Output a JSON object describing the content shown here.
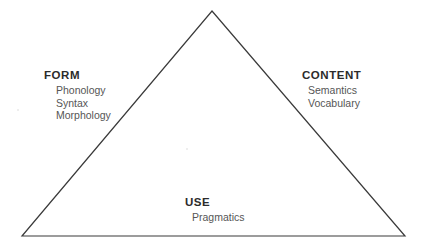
{
  "diagram": {
    "type": "triangle-model",
    "background_color": "#ffffff",
    "stroke_color": "#3a3a3a",
    "heading_color": "#2b2b2b",
    "subtext_color": "#565656",
    "geometry": {
      "apex": [
        212,
        11
      ],
      "bottom_left": [
        22,
        236
      ],
      "bottom_right": [
        405,
        236
      ],
      "stroke_width": 1.2
    },
    "corners": {
      "form": {
        "heading": "FORM",
        "items": [
          "Phonology",
          "Syntax",
          "Morphology"
        ]
      },
      "content": {
        "heading": "CONTENT",
        "items": [
          "Semantics",
          "Vocabulary"
        ]
      },
      "use": {
        "heading": "USE",
        "items": [
          "Pragmatics"
        ]
      }
    }
  }
}
